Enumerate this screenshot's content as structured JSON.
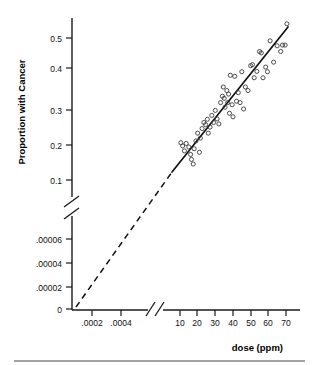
{
  "chart_data": {
    "type": "scatter",
    "title": "",
    "xlabel": "dose (ppm)",
    "ylabel": "Proportion with Cancer",
    "grid": false,
    "legend": null,
    "axis_breaks": {
      "x": "between .0004 and 10 ppm",
      "y": "between .00006 and 0.1"
    },
    "x_tick_labels_low": [
      ".0002",
      ".0004"
    ],
    "x_tick_labels_high": [
      "10",
      "20",
      "30",
      "40",
      "50",
      "60",
      "70"
    ],
    "y_tick_labels_low": [
      "0",
      ".00002",
      ".00004",
      ".00006"
    ],
    "y_tick_labels_high": [
      "0.1",
      "0.2",
      "0.3",
      "0.4",
      "0.5"
    ],
    "xlim_high": [
      5,
      75
    ],
    "ylim_high": [
      0.1,
      0.55
    ],
    "fit_line": {
      "style": "solid in observed range, dashed extrapolation below",
      "x_solid": [
        10,
        72
      ],
      "y_solid": [
        0.145,
        0.525
      ],
      "extrapolation": "dashed from origin region up to x=10"
    },
    "points": [
      {
        "x": 10.5,
        "y": 0.205
      },
      {
        "x": 11.5,
        "y": 0.196
      },
      {
        "x": 12.5,
        "y": 0.182
      },
      {
        "x": 13.5,
        "y": 0.203
      },
      {
        "x": 15.0,
        "y": 0.193
      },
      {
        "x": 16.0,
        "y": 0.172
      },
      {
        "x": 16.5,
        "y": 0.158
      },
      {
        "x": 17.5,
        "y": 0.145
      },
      {
        "x": 18.0,
        "y": 0.188
      },
      {
        "x": 19.0,
        "y": 0.21
      },
      {
        "x": 20.0,
        "y": 0.232
      },
      {
        "x": 21.0,
        "y": 0.178
      },
      {
        "x": 21.5,
        "y": 0.218
      },
      {
        "x": 22.5,
        "y": 0.245
      },
      {
        "x": 23.5,
        "y": 0.262
      },
      {
        "x": 24.5,
        "y": 0.256
      },
      {
        "x": 25.5,
        "y": 0.271
      },
      {
        "x": 26.0,
        "y": 0.232
      },
      {
        "x": 27.0,
        "y": 0.249
      },
      {
        "x": 28.0,
        "y": 0.282
      },
      {
        "x": 29.0,
        "y": 0.262
      },
      {
        "x": 30.0,
        "y": 0.296
      },
      {
        "x": 31.0,
        "y": 0.272
      },
      {
        "x": 32.0,
        "y": 0.258
      },
      {
        "x": 33.0,
        "y": 0.318
      },
      {
        "x": 34.0,
        "y": 0.336
      },
      {
        "x": 34.5,
        "y": 0.362
      },
      {
        "x": 35.0,
        "y": 0.33
      },
      {
        "x": 35.5,
        "y": 0.305
      },
      {
        "x": 36.5,
        "y": 0.352
      },
      {
        "x": 37.0,
        "y": 0.318
      },
      {
        "x": 37.5,
        "y": 0.342
      },
      {
        "x": 38.0,
        "y": 0.288
      },
      {
        "x": 38.5,
        "y": 0.395
      },
      {
        "x": 39.5,
        "y": 0.312
      },
      {
        "x": 40.0,
        "y": 0.278
      },
      {
        "x": 41.0,
        "y": 0.392
      },
      {
        "x": 42.0,
        "y": 0.322
      },
      {
        "x": 43.0,
        "y": 0.346
      },
      {
        "x": 44.0,
        "y": 0.318
      },
      {
        "x": 45.0,
        "y": 0.405
      },
      {
        "x": 46.0,
        "y": 0.3
      },
      {
        "x": 47.0,
        "y": 0.362
      },
      {
        "x": 48.5,
        "y": 0.352
      },
      {
        "x": 50.0,
        "y": 0.422
      },
      {
        "x": 51.0,
        "y": 0.425
      },
      {
        "x": 52.0,
        "y": 0.388
      },
      {
        "x": 53.5,
        "y": 0.406
      },
      {
        "x": 55.0,
        "y": 0.462
      },
      {
        "x": 56.0,
        "y": 0.458
      },
      {
        "x": 57.0,
        "y": 0.388
      },
      {
        "x": 58.5,
        "y": 0.418
      },
      {
        "x": 59.5,
        "y": 0.405
      },
      {
        "x": 61.0,
        "y": 0.492
      },
      {
        "x": 63.0,
        "y": 0.432
      },
      {
        "x": 65.0,
        "y": 0.478
      },
      {
        "x": 67.0,
        "y": 0.462
      },
      {
        "x": 68.0,
        "y": 0.48
      },
      {
        "x": 69.5,
        "y": 0.48
      },
      {
        "x": 70.5,
        "y": 0.54
      }
    ]
  },
  "axes": {
    "y_title": "Proportion with Cancer",
    "x_title": "dose (ppm)",
    "y_ticks_upper": [
      {
        "label": "0.5",
        "py": 38
      },
      {
        "label": "0.4",
        "py": 68
      },
      {
        "label": "0.3",
        "py": 110
      },
      {
        "label": "0.2",
        "py": 145
      },
      {
        "label": "0.1",
        "py": 180
      }
    ],
    "y_ticks_lower": [
      {
        "label": ".00006",
        "py": 239
      },
      {
        "label": ".00004",
        "py": 263
      },
      {
        "label": ".00002",
        "py": 287
      },
      {
        "label": "0",
        "py": 309
      }
    ],
    "x_ticks_low": [
      {
        "label": ".0002",
        "px": 92
      },
      {
        "label": ".0004",
        "px": 121
      }
    ],
    "x_ticks_high": [
      {
        "label": "10",
        "px": 180
      },
      {
        "label": "20",
        "px": 197
      },
      {
        "label": "30",
        "px": 215
      },
      {
        "label": "40",
        "px": 233
      },
      {
        "label": "50",
        "px": 251
      },
      {
        "label": "60",
        "px": 268
      },
      {
        "label": "70",
        "px": 286
      }
    ]
  }
}
